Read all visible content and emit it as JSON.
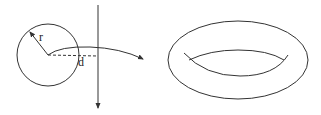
{
  "diagram": {
    "left_figure": {
      "circle": {
        "cx": 48,
        "cy": 55,
        "r": 31
      },
      "labels": {
        "radius": "r",
        "distance": "d"
      },
      "colors": {
        "stroke": "#333333"
      }
    },
    "right_figure": {
      "shape": "torus",
      "outer": {
        "cx": 238,
        "cy": 60,
        "rx": 70,
        "ry": 39
      }
    }
  }
}
